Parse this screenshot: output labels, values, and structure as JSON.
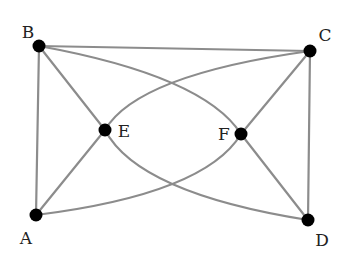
{
  "diagram": {
    "type": "graph",
    "edge_color": "#8c8c8c",
    "node_color": "#000000",
    "nodes": [
      {
        "id": "A",
        "label": "A",
        "x": 36,
        "y": 215,
        "label_x": 26,
        "label_y": 238
      },
      {
        "id": "B",
        "label": "B",
        "x": 39,
        "y": 46,
        "label_x": 28,
        "label_y": 32
      },
      {
        "id": "C",
        "label": "C",
        "x": 310,
        "y": 51,
        "label_x": 325,
        "label_y": 35
      },
      {
        "id": "D",
        "label": "D",
        "x": 308,
        "y": 220,
        "label_x": 322,
        "label_y": 240
      },
      {
        "id": "E",
        "label": "E",
        "x": 105,
        "y": 130,
        "label_x": 124,
        "label_y": 131
      },
      {
        "id": "F",
        "label": "F",
        "x": 241,
        "y": 134,
        "label_x": 224,
        "label_y": 134
      }
    ],
    "edges": [
      {
        "from": "B",
        "to": "C",
        "shape": "straight"
      },
      {
        "from": "B",
        "to": "A",
        "shape": "straight"
      },
      {
        "from": "C",
        "to": "D",
        "shape": "straight"
      },
      {
        "from": "B",
        "to": "E",
        "shape": "straight"
      },
      {
        "from": "A",
        "to": "E",
        "shape": "straight"
      },
      {
        "from": "C",
        "to": "F",
        "shape": "straight"
      },
      {
        "from": "D",
        "to": "F",
        "shape": "straight"
      },
      {
        "from": "B",
        "to": "F",
        "shape": "curve",
        "ctrl": [
          204,
          76
        ]
      },
      {
        "from": "E",
        "to": "C",
        "shape": "curve",
        "ctrl": [
          137,
          75
        ]
      },
      {
        "from": "A",
        "to": "F",
        "shape": "curve",
        "ctrl": [
          205,
          194
        ]
      },
      {
        "from": "E",
        "to": "D",
        "shape": "curve",
        "ctrl": [
          138,
          193
        ]
      }
    ]
  }
}
